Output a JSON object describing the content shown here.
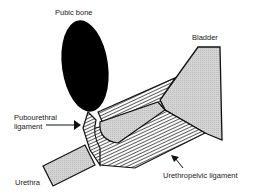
{
  "diagram": {
    "labels": {
      "pubic_bone": "Pubic bone",
      "bladder": "Bladder",
      "pubourethral_line1": "Pubourethral",
      "pubourethral_line2": "ligament",
      "urethra": "Urethra",
      "urethropelvic": "Urethropelvic ligament"
    },
    "colors": {
      "bone": "#000000",
      "tissue_fill": "#cfcfcf",
      "outline": "#111111",
      "hatch": "#333333"
    }
  }
}
